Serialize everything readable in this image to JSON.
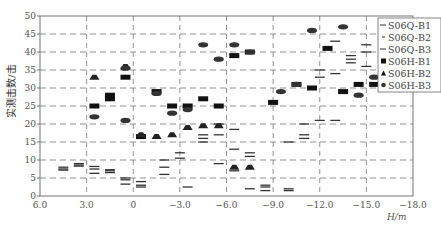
{
  "chart_data": {
    "type": "scatter",
    "title": "",
    "xlabel": "H/m",
    "ylabel": "实测击数/击",
    "xlim": [
      6.0,
      -18.0
    ],
    "ylim": [
      0,
      50
    ],
    "x_ticks": [
      "6.0",
      "3.0",
      "0",
      "-3.0",
      "-6.0",
      "-9.0",
      "-12.0",
      "-15.0",
      "-18.0"
    ],
    "x_tick_values": [
      6,
      3,
      0,
      -3,
      -6,
      -9,
      -12,
      -15,
      -18
    ],
    "y_ticks": [
      "0",
      "5",
      "10",
      "15",
      "20",
      "25",
      "30",
      "35",
      "40",
      "45",
      "50"
    ],
    "y_tick_values": [
      0,
      5,
      10,
      15,
      20,
      25,
      30,
      35,
      40,
      45,
      50
    ],
    "grid": true,
    "legend_position": "upper right",
    "series": [
      {
        "name": "S06Q-B1",
        "marker": "line",
        "points": [
          [
            4.5,
            7.2
          ],
          [
            3.5,
            8.3
          ],
          [
            2.5,
            8.2
          ],
          [
            1.5,
            7.0
          ],
          [
            0.5,
            5.0
          ],
          [
            -0.5,
            4.0
          ],
          [
            -2.0,
            10.0
          ],
          [
            -3.5,
            2.5
          ],
          [
            -4.5,
            16.0
          ],
          [
            -5.5,
            9.0
          ],
          [
            -6.5,
            18.5
          ],
          [
            -7.5,
            12.0
          ],
          [
            -8.5,
            3.0
          ],
          [
            -10.0,
            2.0
          ],
          [
            -11.0,
            17.0
          ],
          [
            -12.0,
            35.0
          ],
          [
            -13.0,
            43.0
          ],
          [
            -14.0,
            37.0
          ],
          [
            -15.0,
            40.0
          ]
        ]
      },
      {
        "name": "S06Q-B2",
        "marker": "line",
        "points": [
          [
            4.5,
            8.0
          ],
          [
            3.5,
            9.0
          ],
          [
            2.5,
            6.3
          ],
          [
            1.5,
            6.5
          ],
          [
            0.5,
            3.3
          ],
          [
            -0.5,
            2.5
          ],
          [
            -2.0,
            6.0
          ],
          [
            -3.0,
            12.0
          ],
          [
            -4.5,
            17.0
          ],
          [
            -5.5,
            20.0
          ],
          [
            -6.5,
            7.0
          ],
          [
            -7.5,
            2.0
          ],
          [
            -8.5,
            1.5
          ],
          [
            -10.0,
            1.5
          ],
          [
            -11.0,
            16.0
          ],
          [
            -12.0,
            33.0
          ],
          [
            -13.0,
            34.0
          ],
          [
            -14.0,
            38.0
          ],
          [
            -15.0,
            36.0
          ]
        ]
      },
      {
        "name": "S06Q-B3",
        "marker": "line",
        "points": [
          [
            4.5,
            7.5
          ],
          [
            3.5,
            8.6
          ],
          [
            2.5,
            7.5
          ],
          [
            1.5,
            7.3
          ],
          [
            0.5,
            4.5
          ],
          [
            -0.5,
            3.0
          ],
          [
            -2.0,
            8.0
          ],
          [
            -3.0,
            10.5
          ],
          [
            -4.5,
            15.0
          ],
          [
            -5.5,
            17.0
          ],
          [
            -6.5,
            13.0
          ],
          [
            -7.5,
            11.0
          ],
          [
            -8.5,
            2.5
          ],
          [
            -10.0,
            15.0
          ],
          [
            -11.0,
            20.0
          ],
          [
            -12.0,
            21.0
          ],
          [
            -13.0,
            21.0
          ],
          [
            -14.0,
            39.0
          ],
          [
            -15.0,
            42.0
          ]
        ]
      },
      {
        "name": "S06H-B1",
        "marker": "square",
        "points": [
          [
            2.5,
            25.0
          ],
          [
            1.5,
            28.0
          ],
          [
            1.5,
            27.0
          ],
          [
            0.5,
            33.0
          ],
          [
            -0.5,
            16.5
          ],
          [
            -1.5,
            29.0
          ],
          [
            -2.5,
            25.0
          ],
          [
            -3.5,
            25.0
          ],
          [
            -4.5,
            27.0
          ],
          [
            -5.5,
            25.0
          ],
          [
            -6.5,
            39.0
          ],
          [
            -7.5,
            40.0
          ],
          [
            -9.0,
            26.0
          ],
          [
            -10.5,
            31.0
          ],
          [
            -11.5,
            30.0
          ],
          [
            -12.5,
            41.0
          ],
          [
            -13.5,
            29.0
          ],
          [
            -14.5,
            31.0
          ],
          [
            -15.5,
            31.0
          ]
        ]
      },
      {
        "name": "S06H-B2",
        "marker": "triangle",
        "points": [
          [
            2.5,
            33.0
          ],
          [
            0.5,
            36.0
          ],
          [
            -0.5,
            17.0
          ],
          [
            -1.5,
            16.5
          ],
          [
            -2.5,
            17.0
          ],
          [
            -3.5,
            19.0
          ],
          [
            -4.5,
            19.5
          ],
          [
            -5.5,
            19.5
          ],
          [
            -6.5,
            8.0
          ],
          [
            -7.5,
            8.0
          ]
        ]
      },
      {
        "name": "S06H-B3",
        "marker": "circle",
        "points": [
          [
            2.5,
            22.0
          ],
          [
            0.5,
            35.5
          ],
          [
            0.5,
            21.0
          ],
          [
            -1.5,
            28.5
          ],
          [
            -2.5,
            23.0
          ],
          [
            -3.5,
            24.0
          ],
          [
            -4.5,
            42.0
          ],
          [
            -5.5,
            38.0
          ],
          [
            -6.5,
            42.0
          ],
          [
            -7.5,
            40.0
          ],
          [
            -9.5,
            29.0
          ],
          [
            -10.5,
            31.0
          ],
          [
            -11.5,
            46.0
          ],
          [
            -12.5,
            51.0
          ],
          [
            -13.5,
            47.0
          ],
          [
            -14.5,
            28.0
          ],
          [
            -15.5,
            33.0
          ]
        ]
      }
    ]
  },
  "legend": {
    "items": [
      {
        "label": "S06Q-B1",
        "marker": "line"
      },
      {
        "label": "S06Q-B2",
        "marker": "dash"
      },
      {
        "label": "S06Q-B3",
        "marker": "line"
      },
      {
        "label": "S06H-B1",
        "marker": "square"
      },
      {
        "label": "S06H-B2",
        "marker": "triangle"
      },
      {
        "label": "S06H-B3",
        "marker": "circle"
      }
    ]
  }
}
